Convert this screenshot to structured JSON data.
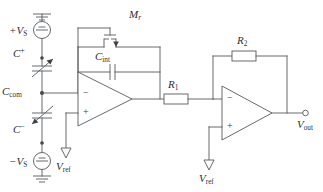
{
  "diagram": {
    "background_color": "#ffffff",
    "line_color": "#55595d",
    "text_color": "#2d3034"
  },
  "labels": {
    "vs_pos": {
      "main": "+V",
      "sub": "S"
    },
    "vs_neg": {
      "main": "−V",
      "sub": "S"
    },
    "cap_pos": {
      "main": "C",
      "sup": "+"
    },
    "cap_neg": {
      "main": "C",
      "sup": "−"
    },
    "cap_com": {
      "main": "C",
      "sub": "com"
    },
    "cap_int": {
      "main": "C",
      "sub": "int"
    },
    "mosfet": {
      "main": "M",
      "sub": "r"
    },
    "res_1": {
      "main": "R",
      "sub": "1"
    },
    "res_2": {
      "main": "R",
      "sub": "2"
    },
    "vref_1": {
      "main": "V",
      "sub": "ref"
    },
    "vref_2": {
      "main": "V",
      "sub": "ref"
    },
    "vout": {
      "main": "V",
      "sub": "out"
    }
  },
  "opamp_signs": {
    "amp1_inverting": "−",
    "amp1_noninverting": "+",
    "amp2_inverting": "−",
    "amp2_noninverting": "+"
  },
  "components": [
    {
      "id": "source-vs-pos",
      "type": "voltage-source",
      "label": "+V_S"
    },
    {
      "id": "source-vs-neg",
      "type": "voltage-source",
      "label": "−V_S"
    },
    {
      "id": "cap-variable-pos",
      "type": "variable-capacitor",
      "label": "C+"
    },
    {
      "id": "cap-variable-neg",
      "type": "variable-capacitor",
      "label": "C−"
    },
    {
      "id": "cap-integration",
      "type": "capacitor",
      "label": "C_int"
    },
    {
      "id": "mosfet-reset",
      "type": "mosfet",
      "label": "M_r"
    },
    {
      "id": "opamp-charge",
      "type": "opamp",
      "label": ""
    },
    {
      "id": "resistor-r1",
      "type": "resistor",
      "label": "R_1"
    },
    {
      "id": "resistor-r2",
      "type": "resistor",
      "label": "R_2"
    },
    {
      "id": "opamp-gain",
      "type": "opamp",
      "label": ""
    },
    {
      "id": "ground-top",
      "type": "ground",
      "label": ""
    },
    {
      "id": "ground-bottom",
      "type": "ground",
      "label": ""
    },
    {
      "id": "ref-arrow-1",
      "type": "reference",
      "label": "V_ref"
    },
    {
      "id": "ref-arrow-2",
      "type": "reference",
      "label": "V_ref"
    },
    {
      "id": "terminal-vout",
      "type": "open-terminal",
      "label": "V_out"
    }
  ],
  "nodes": [
    {
      "id": "node-cplus-top",
      "x": 42,
      "y": 58
    },
    {
      "id": "node-ccom",
      "x": 42,
      "y": 93
    },
    {
      "id": "node-cminus-bot",
      "x": 42,
      "y": 143
    },
    {
      "id": "node-r1-r2-junction",
      "x": 213,
      "y": 99
    }
  ]
}
